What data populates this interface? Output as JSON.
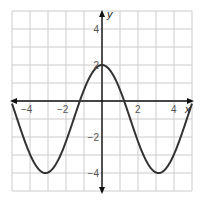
{
  "chart_data": {
    "type": "line",
    "title": "",
    "xlabel": "x",
    "ylabel": "y",
    "xlim": [
      -5,
      5
    ],
    "ylim": [
      -5,
      5
    ],
    "grid": true,
    "x_ticks": [
      {
        "value": -4,
        "label": "−4"
      },
      {
        "value": -2,
        "label": "−2"
      },
      {
        "value": 2,
        "label": "2"
      },
      {
        "value": 4,
        "label": "4"
      }
    ],
    "y_ticks": [
      {
        "value": 4,
        "label": "4"
      },
      {
        "value": 2,
        "label": "2"
      },
      {
        "value": -2,
        "label": "−2"
      },
      {
        "value": -4,
        "label": "−4"
      }
    ],
    "series": [
      {
        "name": "y = 3cos(x) − 1",
        "function": "3*cos(x)-1",
        "x": [
          -5,
          -4,
          -3.14,
          -2,
          -1.23,
          0,
          1.23,
          2,
          3.14,
          4,
          5
        ],
        "values": [
          -0.15,
          -2.96,
          -4,
          -2.25,
          0,
          2,
          0,
          -2.25,
          -4,
          -2.96,
          -0.15
        ]
      }
    ],
    "key_points": {
      "maximum": [
        0,
        2
      ],
      "minima": [
        [
          -3.14,
          -4
        ],
        [
          3.14,
          -4
        ]
      ],
      "x_intercepts": [
        -1.23,
        1.23
      ]
    }
  },
  "colors": {
    "grid": "#cccccc",
    "axis": "#111111",
    "curve": "#333333"
  }
}
